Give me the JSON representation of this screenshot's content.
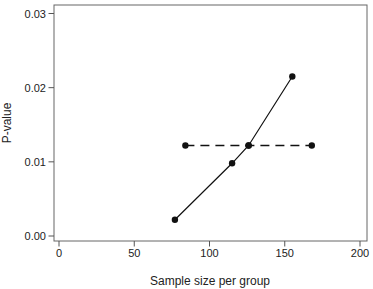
{
  "figure": {
    "background": "#ffffff",
    "line_color": "#111111",
    "box_color": "#666666",
    "tick_color": "#555555",
    "text_color": "#222222"
  },
  "chart_data": {
    "type": "line",
    "title": "",
    "xlabel": "Sample size per group",
    "ylabel": "P-value",
    "xlim": [
      0,
      200
    ],
    "ylim": [
      0,
      0.03
    ],
    "x_tick_labels": [
      "0",
      "50",
      "100",
      "150",
      "200"
    ],
    "y_tick_labels": [
      "0.00",
      "0.01",
      "0.02",
      "0.03"
    ],
    "grid": false,
    "legend": "none",
    "frame": "full-box",
    "series": [
      {
        "name": "solid-series",
        "style": "solid",
        "marker": "filled-circle",
        "points": [
          [
            77,
            0.0022
          ],
          [
            115,
            0.0098
          ],
          [
            126,
            0.0122
          ],
          [
            155,
            0.0215
          ]
        ]
      },
      {
        "name": "dashed-series",
        "style": "dashed",
        "marker": "filled-circle",
        "points": [
          [
            84,
            0.0122
          ],
          [
            126,
            0.0122
          ],
          [
            168,
            0.0122
          ]
        ]
      }
    ]
  }
}
